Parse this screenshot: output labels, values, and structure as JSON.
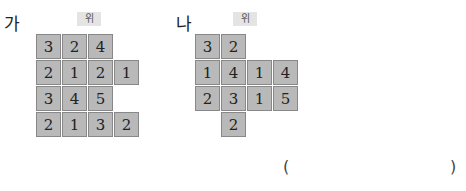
{
  "figure_a": {
    "label": "가",
    "tag": "위",
    "cells": [
      {
        "r": 0,
        "c": 0,
        "v": "3"
      },
      {
        "r": 0,
        "c": 1,
        "v": "2"
      },
      {
        "r": 0,
        "c": 2,
        "v": "4"
      },
      {
        "r": 1,
        "c": 0,
        "v": "2"
      },
      {
        "r": 1,
        "c": 1,
        "v": "1"
      },
      {
        "r": 1,
        "c": 2,
        "v": "2"
      },
      {
        "r": 1,
        "c": 3,
        "v": "1"
      },
      {
        "r": 2,
        "c": 0,
        "v": "3"
      },
      {
        "r": 2,
        "c": 1,
        "v": "4"
      },
      {
        "r": 2,
        "c": 2,
        "v": "5"
      },
      {
        "r": 3,
        "c": 0,
        "v": "2"
      },
      {
        "r": 3,
        "c": 1,
        "v": "1"
      },
      {
        "r": 3,
        "c": 2,
        "v": "3"
      },
      {
        "r": 3,
        "c": 3,
        "v": "2"
      }
    ]
  },
  "figure_b": {
    "label": "나",
    "tag": "위",
    "cells": [
      {
        "r": 0,
        "c": 0,
        "v": "3"
      },
      {
        "r": 0,
        "c": 1,
        "v": "2"
      },
      {
        "r": 1,
        "c": 0,
        "v": "1"
      },
      {
        "r": 1,
        "c": 1,
        "v": "4"
      },
      {
        "r": 1,
        "c": 2,
        "v": "1"
      },
      {
        "r": 1,
        "c": 3,
        "v": "4"
      },
      {
        "r": 2,
        "c": 0,
        "v": "2"
      },
      {
        "r": 2,
        "c": 1,
        "v": "3"
      },
      {
        "r": 2,
        "c": 2,
        "v": "1"
      },
      {
        "r": 2,
        "c": 3,
        "v": "5"
      },
      {
        "r": 3,
        "c": 1,
        "v": "2"
      }
    ]
  },
  "answer": {
    "open": "(",
    "close": ")"
  }
}
